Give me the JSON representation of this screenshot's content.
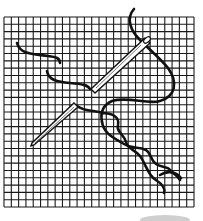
{
  "illustration": {
    "subject": "embroidery needle and thread on grid fabric",
    "grid": {
      "x": 4,
      "y": 17,
      "width": 190,
      "height": 190,
      "cells": 26,
      "color": "#1a1a1a"
    },
    "thread_color": "#111111",
    "background": "#ffffff"
  }
}
